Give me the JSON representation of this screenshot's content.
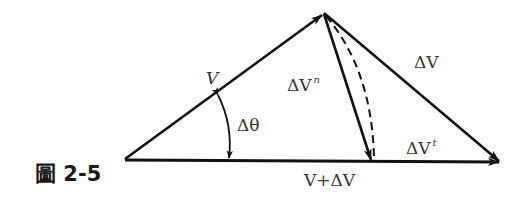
{
  "figure": {
    "caption_prefix": "圖",
    "caption_number": "2-5"
  },
  "labels": {
    "V": "V",
    "delta_theta": "Δθ",
    "delta_V_n_base": "ΔV",
    "delta_V_n_sup": "n",
    "delta_V": "ΔV",
    "delta_V_t_base": "ΔV",
    "delta_V_t_sup": "t",
    "bottom": "V+ΔV"
  },
  "geometry": {
    "left_vertex": [
      125,
      159
    ],
    "apex": [
      324,
      13
    ],
    "right_tip": [
      500,
      162
    ],
    "normal_tip": [
      372,
      162
    ]
  },
  "colors": {
    "stroke": "#111111",
    "text": "#333333"
  }
}
